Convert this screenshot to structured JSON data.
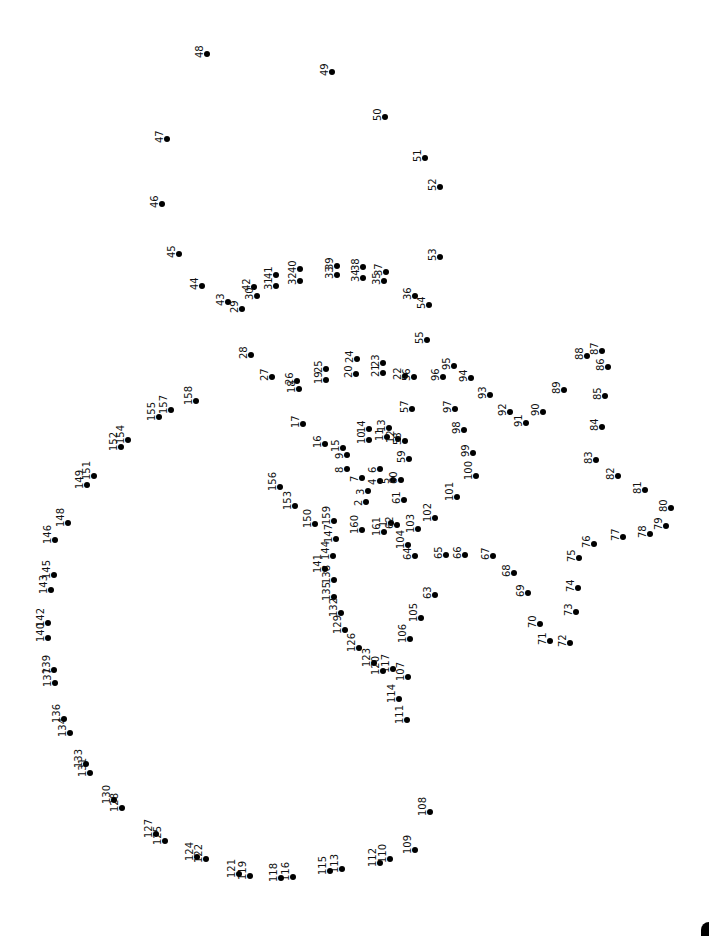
{
  "puzzle": {
    "type": "connect-the-dots",
    "rotation_deg": -90,
    "dot_color": "#000000",
    "background": "#ffffff",
    "dots": [
      {
        "n": "1",
        "x": 391,
        "y": 523
      },
      {
        "n": "2",
        "x": 366,
        "y": 502
      },
      {
        "n": "3",
        "x": 368,
        "y": 491
      },
      {
        "n": "4",
        "x": 380,
        "y": 481
      },
      {
        "n": "5",
        "x": 393,
        "y": 480
      },
      {
        "n": "6",
        "x": 380,
        "y": 469
      },
      {
        "n": "7",
        "x": 362,
        "y": 478
      },
      {
        "n": "8",
        "x": 347,
        "y": 469
      },
      {
        "n": "9",
        "x": 347,
        "y": 455
      },
      {
        "n": "10",
        "x": 369,
        "y": 440
      },
      {
        "n": "11",
        "x": 387,
        "y": 437
      },
      {
        "n": "12",
        "x": 398,
        "y": 439
      },
      {
        "n": "13",
        "x": 389,
        "y": 428
      },
      {
        "n": "14",
        "x": 369,
        "y": 429
      },
      {
        "n": "15",
        "x": 343,
        "y": 448
      },
      {
        "n": "16",
        "x": 325,
        "y": 444
      },
      {
        "n": "17",
        "x": 303,
        "y": 424
      },
      {
        "n": "18",
        "x": 299,
        "y": 389
      },
      {
        "n": "19",
        "x": 326,
        "y": 380
      },
      {
        "n": "20",
        "x": 356,
        "y": 374
      },
      {
        "n": "21",
        "x": 383,
        "y": 373
      },
      {
        "n": "22",
        "x": 405,
        "y": 376
      },
      {
        "n": "23",
        "x": 383,
        "y": 363
      },
      {
        "n": "24",
        "x": 357,
        "y": 359
      },
      {
        "n": "25",
        "x": 326,
        "y": 369
      },
      {
        "n": "26",
        "x": 297,
        "y": 381
      },
      {
        "n": "27",
        "x": 272,
        "y": 377
      },
      {
        "n": "28",
        "x": 251,
        "y": 355
      },
      {
        "n": "29",
        "x": 242,
        "y": 309
      },
      {
        "n": "30",
        "x": 257,
        "y": 296
      },
      {
        "n": "31",
        "x": 276,
        "y": 286
      },
      {
        "n": "32",
        "x": 300,
        "y": 281
      },
      {
        "n": "33",
        "x": 337,
        "y": 275
      },
      {
        "n": "34",
        "x": 363,
        "y": 278
      },
      {
        "n": "35",
        "x": 384,
        "y": 281
      },
      {
        "n": "36",
        "x": 415,
        "y": 296
      },
      {
        "n": "37",
        "x": 386,
        "y": 272
      },
      {
        "n": "38",
        "x": 363,
        "y": 267
      },
      {
        "n": "39",
        "x": 337,
        "y": 266
      },
      {
        "n": "40",
        "x": 300,
        "y": 269
      },
      {
        "n": "41",
        "x": 276,
        "y": 275
      },
      {
        "n": "42",
        "x": 254,
        "y": 287
      },
      {
        "n": "43",
        "x": 228,
        "y": 302
      },
      {
        "n": "44",
        "x": 202,
        "y": 286
      },
      {
        "n": "45",
        "x": 179,
        "y": 254
      },
      {
        "n": "46",
        "x": 162,
        "y": 204
      },
      {
        "n": "47",
        "x": 167,
        "y": 139
      },
      {
        "n": "48",
        "x": 207,
        "y": 54
      },
      {
        "n": "49",
        "x": 332,
        "y": 72
      },
      {
        "n": "50",
        "x": 385,
        "y": 117
      },
      {
        "n": "51",
        "x": 425,
        "y": 158
      },
      {
        "n": "52",
        "x": 440,
        "y": 187
      },
      {
        "n": "53",
        "x": 440,
        "y": 257
      },
      {
        "n": "54",
        "x": 429,
        "y": 305
      },
      {
        "n": "55",
        "x": 427,
        "y": 340
      },
      {
        "n": "56",
        "x": 414,
        "y": 377
      },
      {
        "n": "57",
        "x": 412,
        "y": 409
      },
      {
        "n": "58",
        "x": 405,
        "y": 441
      },
      {
        "n": "59",
        "x": 409,
        "y": 459
      },
      {
        "n": "60",
        "x": 401,
        "y": 480
      },
      {
        "n": "61",
        "x": 404,
        "y": 500
      },
      {
        "n": "62",
        "x": 397,
        "y": 525
      },
      {
        "n": "63",
        "x": 435,
        "y": 595
      },
      {
        "n": "64",
        "x": 415,
        "y": 556
      },
      {
        "n": "65",
        "x": 446,
        "y": 555
      },
      {
        "n": "66",
        "x": 465,
        "y": 555
      },
      {
        "n": "67",
        "x": 493,
        "y": 556
      },
      {
        "n": "68",
        "x": 514,
        "y": 573
      },
      {
        "n": "69",
        "x": 528,
        "y": 593
      },
      {
        "n": "70",
        "x": 540,
        "y": 624
      },
      {
        "n": "71",
        "x": 550,
        "y": 641
      },
      {
        "n": "72",
        "x": 570,
        "y": 643
      },
      {
        "n": "73",
        "x": 576,
        "y": 612
      },
      {
        "n": "74",
        "x": 578,
        "y": 588
      },
      {
        "n": "75",
        "x": 579,
        "y": 558
      },
      {
        "n": "76",
        "x": 594,
        "y": 544
      },
      {
        "n": "77",
        "x": 623,
        "y": 537
      },
      {
        "n": "78",
        "x": 650,
        "y": 534
      },
      {
        "n": "79",
        "x": 666,
        "y": 526
      },
      {
        "n": "80",
        "x": 671,
        "y": 508
      },
      {
        "n": "81",
        "x": 645,
        "y": 490
      },
      {
        "n": "82",
        "x": 618,
        "y": 476
      },
      {
        "n": "83",
        "x": 596,
        "y": 460
      },
      {
        "n": "84",
        "x": 602,
        "y": 427
      },
      {
        "n": "85",
        "x": 605,
        "y": 396
      },
      {
        "n": "86",
        "x": 608,
        "y": 367
      },
      {
        "n": "87",
        "x": 602,
        "y": 351
      },
      {
        "n": "88",
        "x": 587,
        "y": 356
      },
      {
        "n": "89",
        "x": 564,
        "y": 390
      },
      {
        "n": "90",
        "x": 543,
        "y": 412
      },
      {
        "n": "91",
        "x": 526,
        "y": 423
      },
      {
        "n": "92",
        "x": 510,
        "y": 412
      },
      {
        "n": "93",
        "x": 490,
        "y": 395
      },
      {
        "n": "94",
        "x": 471,
        "y": 378
      },
      {
        "n": "95",
        "x": 454,
        "y": 366
      },
      {
        "n": "96",
        "x": 443,
        "y": 377
      },
      {
        "n": "97",
        "x": 455,
        "y": 409
      },
      {
        "n": "98",
        "x": 464,
        "y": 430
      },
      {
        "n": "99",
        "x": 473,
        "y": 453
      },
      {
        "n": "100",
        "x": 476,
        "y": 476
      },
      {
        "n": "101",
        "x": 457,
        "y": 497
      },
      {
        "n": "102",
        "x": 435,
        "y": 518
      },
      {
        "n": "103",
        "x": 418,
        "y": 529
      },
      {
        "n": "104",
        "x": 408,
        "y": 545
      },
      {
        "n": "105",
        "x": 421,
        "y": 618
      },
      {
        "n": "106",
        "x": 410,
        "y": 639
      },
      {
        "n": "107",
        "x": 408,
        "y": 677
      },
      {
        "n": "108",
        "x": 430,
        "y": 812
      },
      {
        "n": "109",
        "x": 415,
        "y": 850
      },
      {
        "n": "110",
        "x": 390,
        "y": 859
      },
      {
        "n": "111",
        "x": 407,
        "y": 720
      },
      {
        "n": "112",
        "x": 380,
        "y": 863
      },
      {
        "n": "113",
        "x": 342,
        "y": 869
      },
      {
        "n": "114",
        "x": 399,
        "y": 699
      },
      {
        "n": "115",
        "x": 330,
        "y": 871
      },
      {
        "n": "116",
        "x": 293,
        "y": 877
      },
      {
        "n": "117",
        "x": 393,
        "y": 669
      },
      {
        "n": "118",
        "x": 281,
        "y": 878
      },
      {
        "n": "119",
        "x": 250,
        "y": 876
      },
      {
        "n": "120",
        "x": 383,
        "y": 671
      },
      {
        "n": "121",
        "x": 239,
        "y": 874
      },
      {
        "n": "122",
        "x": 206,
        "y": 859
      },
      {
        "n": "123",
        "x": 374,
        "y": 663
      },
      {
        "n": "124",
        "x": 197,
        "y": 857
      },
      {
        "n": "125",
        "x": 165,
        "y": 841
      },
      {
        "n": "126",
        "x": 359,
        "y": 648
      },
      {
        "n": "127",
        "x": 156,
        "y": 834
      },
      {
        "n": "128",
        "x": 122,
        "y": 808
      },
      {
        "n": "129",
        "x": 345,
        "y": 630
      },
      {
        "n": "130",
        "x": 114,
        "y": 800
      },
      {
        "n": "131",
        "x": 90,
        "y": 773
      },
      {
        "n": "132",
        "x": 341,
        "y": 613
      },
      {
        "n": "133",
        "x": 86,
        "y": 764
      },
      {
        "n": "134",
        "x": 70,
        "y": 733
      },
      {
        "n": "135",
        "x": 334,
        "y": 597
      },
      {
        "n": "136",
        "x": 64,
        "y": 719
      },
      {
        "n": "137",
        "x": 55,
        "y": 683
      },
      {
        "n": "138",
        "x": 334,
        "y": 580
      },
      {
        "n": "139",
        "x": 54,
        "y": 670
      },
      {
        "n": "140",
        "x": 48,
        "y": 638
      },
      {
        "n": "141",
        "x": 325,
        "y": 569
      },
      {
        "n": "142",
        "x": 48,
        "y": 623
      },
      {
        "n": "143",
        "x": 51,
        "y": 590
      },
      {
        "n": "144",
        "x": 333,
        "y": 556
      },
      {
        "n": "145",
        "x": 54,
        "y": 575
      },
      {
        "n": "146",
        "x": 55,
        "y": 540
      },
      {
        "n": "147",
        "x": 336,
        "y": 539
      },
      {
        "n": "148",
        "x": 68,
        "y": 523
      },
      {
        "n": "149",
        "x": 87,
        "y": 485
      },
      {
        "n": "150",
        "x": 315,
        "y": 524
      },
      {
        "n": "151",
        "x": 94,
        "y": 476
      },
      {
        "n": "152",
        "x": 121,
        "y": 447
      },
      {
        "n": "153",
        "x": 295,
        "y": 506
      },
      {
        "n": "154",
        "x": 128,
        "y": 440
      },
      {
        "n": "155",
        "x": 159,
        "y": 417
      },
      {
        "n": "156",
        "x": 280,
        "y": 487
      },
      {
        "n": "157",
        "x": 171,
        "y": 410
      },
      {
        "n": "158",
        "x": 196,
        "y": 401
      },
      {
        "n": "159",
        "x": 334,
        "y": 521
      },
      {
        "n": "160",
        "x": 362,
        "y": 530
      },
      {
        "n": "161",
        "x": 384,
        "y": 532
      }
    ]
  }
}
